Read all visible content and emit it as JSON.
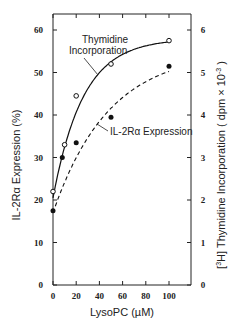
{
  "chart_data": {
    "type": "line",
    "title": "",
    "xlabel": "LysoPC (µM)",
    "ylabel": "IL-2Rα Expression (%)",
    "y2label": "[3H] Thymidine Incorporation ( dpm × 10^-3 )",
    "xlim": [
      0,
      110
    ],
    "ylim": [
      0,
      65
    ],
    "y2lim": [
      0,
      6.5
    ],
    "xticks": [
      0,
      20,
      40,
      60,
      80,
      100
    ],
    "yticks": [
      0,
      10,
      20,
      30,
      40,
      50,
      60
    ],
    "y2ticks": [
      0,
      1,
      2,
      3,
      4,
      5,
      6
    ],
    "grid": false,
    "legend": "inline annotations",
    "series": [
      {
        "name": "Thymidine Incorporation",
        "marker": "open-circle",
        "line": "solid",
        "axis": "right",
        "x": [
          0,
          10,
          20,
          50,
          100
        ],
        "values": [
          2.2,
          3.3,
          4.45,
          5.2,
          5.75
        ]
      },
      {
        "name": "IL-2Rα Expression",
        "marker": "filled-circle",
        "line": "dashed",
        "axis": "left",
        "x": [
          0,
          8,
          20,
          50,
          100
        ],
        "values": [
          17.5,
          30,
          33.5,
          39.5,
          51.5
        ]
      }
    ],
    "annotations": [
      {
        "text_lines": [
          "Thymidine",
          "Incorporation"
        ],
        "points_to": "Thymidine Incorporation"
      },
      {
        "text_lines": [
          "IL-2Rα Expression"
        ],
        "points_to": "IL-2Rα Expression"
      }
    ]
  },
  "labels": {
    "xlabel": "LysoPC (µM)",
    "ylabel": "IL-2Rα Expression (%)",
    "y2label_pre": "[",
    "y2label_sup": "3",
    "y2label_mid": "H] Thymidine Incorporation  ( dpm × 10",
    "y2label_exp": "-3",
    "y2label_post": " )",
    "ann_thy_1": "Thymidine",
    "ann_thy_2": "Incorporation",
    "ann_il2": "IL-2Rα Expression"
  }
}
